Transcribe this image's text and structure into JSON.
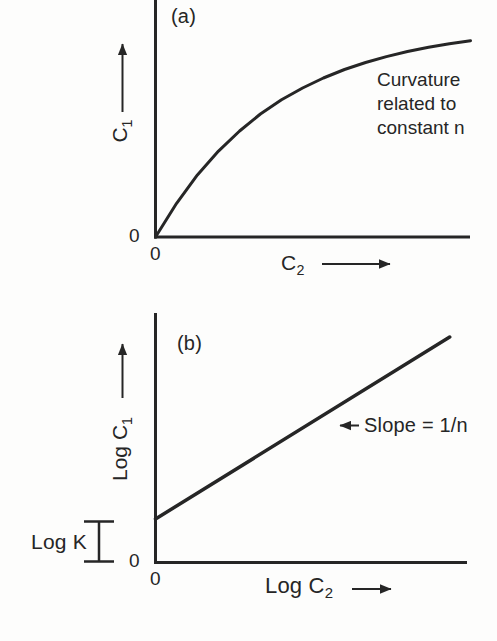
{
  "colors": {
    "ink": "#262626",
    "background": "#fdfdfc"
  },
  "chart_data": [
    {
      "id": "a",
      "type": "line",
      "panel_label": "(a)",
      "xlabel": "C2",
      "ylabel": "C1",
      "xlabel_main": "C",
      "xlabel_sub": "2",
      "ylabel_main": "C",
      "ylabel_sub": "1",
      "x_axis_zero": "0",
      "y_axis_zero": "0",
      "annotation": "Curvature related to constant n",
      "grid": false,
      "legend": false,
      "xlim": [
        0,
        1
      ],
      "ylim": [
        0,
        1
      ],
      "x": [
        0,
        0.067,
        0.133,
        0.2,
        0.267,
        0.333,
        0.4,
        0.467,
        0.533,
        0.6,
        0.667,
        0.733,
        0.8,
        0.867,
        0.933,
        1.0
      ],
      "y": [
        0,
        0.159,
        0.293,
        0.405,
        0.5,
        0.58,
        0.647,
        0.703,
        0.75,
        0.79,
        0.823,
        0.851,
        0.875,
        0.895,
        0.912,
        0.926
      ]
    },
    {
      "id": "b",
      "type": "line",
      "panel_label": "(b)",
      "xlabel": "Log C2",
      "ylabel": "Log C1",
      "xlabel_main": "Log C",
      "xlabel_sub": "2",
      "ylabel_main": "Log C",
      "ylabel_sub": "1",
      "x_axis_zero": "0",
      "y_axis_zero": "0",
      "slope_annotation": "Slope = 1/n",
      "intercept_label": "Log K",
      "grid": false,
      "legend": false,
      "xlim": [
        0,
        1
      ],
      "ylim": [
        0,
        1
      ],
      "x": [
        0,
        0.94
      ],
      "y": [
        0.174,
        0.902
      ]
    }
  ]
}
